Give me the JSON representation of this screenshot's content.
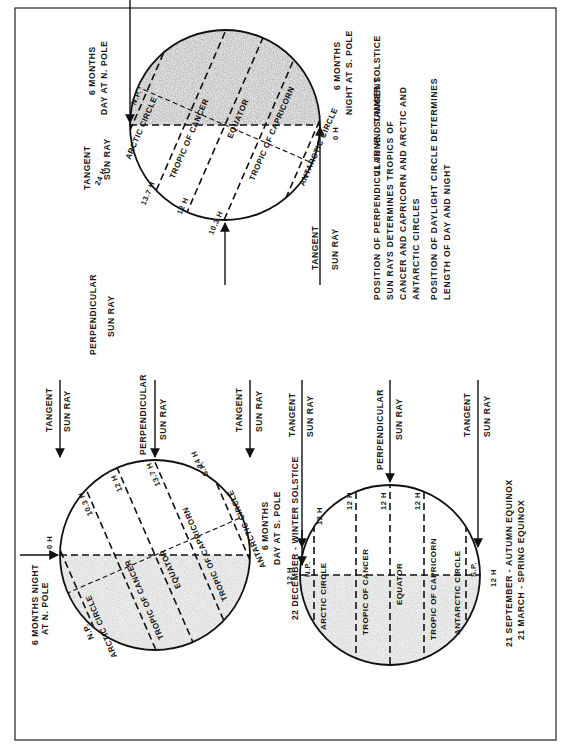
{
  "figure": {
    "orientation": "rotated 90 degrees counter-clockwise",
    "colors": {
      "ink": "#111111",
      "night_shade": "#8a8a8a",
      "paper": "#ffffff"
    },
    "panels": {
      "winter_solstice": {
        "caption": "22 DECEMBER - WINTER SOLSTICE",
        "north_label_line1": "6 MONTHS NIGHT",
        "north_label_line2": "AT N. POLE",
        "south_label_line1": "6 MONTHS",
        "south_label_line2": "DAY AT S. POLE",
        "tangent_ray_top": {
          "line1": "TANGENT",
          "line2": "SUN RAY"
        },
        "tangent_ray_bottom": {
          "line1": "TANGENT",
          "line2": "SUN RAY"
        },
        "perpendicular_ray": {
          "line1": "PERPENDICULAR",
          "line2": "SUN RAY"
        },
        "circles": {
          "np": "N.P.",
          "sp": "S.P.",
          "arctic": "ARCTIC CIRCLE",
          "cancer": "TROPIC OF CANCER",
          "equator": "EQUATOR",
          "capricorn": "TROPIC OF CAPRICORN",
          "antarctic": "ANTARCTIC CIRCLE"
        },
        "day_lengths": {
          "north_pole": "0 H",
          "cancer": "10.3 H",
          "equator": "12 H",
          "capricorn": "13.7 H",
          "antarctic": "24 H"
        }
      },
      "equinox": {
        "caption_line1": "21 SEPTEMBER - AUTUMN EQUINOX",
        "caption_line2": "21 MARCH - SPRING EQUINOX",
        "tangent_ray_top": {
          "line1": "TANGENT",
          "line2": "SUN RAY"
        },
        "tangent_ray_bottom": {
          "line1": "TANGENT",
          "line2": "SUN RAY"
        },
        "perpendicular_ray": {
          "line1": "PERPENDICULAR",
          "line2": "SUN RAY"
        },
        "circles": {
          "np": "N.P.",
          "sp": "S.P.",
          "arctic": "ARCTIC CIRCLE",
          "cancer": "TROPIC OF CANCER",
          "equator": "EQUATOR",
          "capricorn": "TROPIC OF CAPRICORN",
          "antarctic": "ANTARCTIC CIRCLE"
        },
        "day_lengths": {
          "north_pole": "12 H",
          "arctic": "12 H",
          "cancer": "12 H",
          "equator": "12 H",
          "capricorn": "12 H",
          "south_pole": "12 H"
        }
      },
      "summer_solstice": {
        "caption": "21 JUNE - SUMMER SOLSTICE",
        "north_label_line1": "6 MONTHS",
        "north_label_line2": "DAY AT N. POLE",
        "south_label_line1": "6 MONTHS",
        "south_label_line2": "NIGHT AT S. POLE",
        "tangent_ray_top": {
          "line1": "TANGENT",
          "line2": "SUN RAY"
        },
        "tangent_ray_bottom": {
          "line1": "TANGENT",
          "line2": "SUN RAY"
        },
        "perpendicular_ray": {
          "line1": "PERPENDICULAR",
          "line2": "SUN RAY"
        },
        "circles": {
          "np": "N.P.",
          "sp": "S.P.",
          "arctic": "ARCTIC CIRCLE",
          "cancer": "TROPIC OF CANCER",
          "equator": "EQUATOR",
          "capricorn": "TROPIC OF CAPRICORN",
          "antarctic": "ANTARCTIC CIRCLE"
        },
        "day_lengths": {
          "arctic": "24 H",
          "cancer": "13.7 H",
          "equator": "12 H",
          "capricorn": "10.3 H",
          "south_pole": "0 H"
        }
      }
    },
    "explanation": {
      "para1_line1": "POSITION OF PERPENDICULAR AND TANGENT",
      "para1_line2": "SUN RAYS DETERMINES TROPICS OF",
      "para1_line3": "CANCER AND CAPRICORN AND ARCTIC AND",
      "para1_line4": "ANTARCTIC CIRCLES",
      "para2_line1": "POSITION OF DAYLIGHT CIRCLE DETERMINES",
      "para2_line2": "LENGTH OF DAY AND NIGHT"
    }
  }
}
